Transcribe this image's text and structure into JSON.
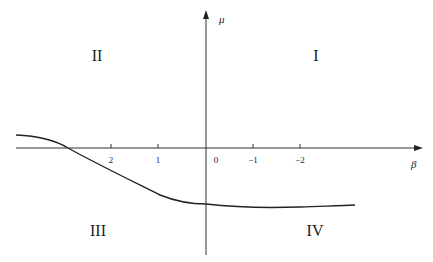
{
  "diagram": {
    "axes": {
      "horizontal_label": "β",
      "vertical_label": "μ"
    },
    "ticks": [
      {
        "label": "2",
        "x": 111
      },
      {
        "label": "1",
        "x": 158
      },
      {
        "label": "0",
        "x": 216
      },
      {
        "label": "−1",
        "x": 253
      },
      {
        "label": "−2",
        "x": 300
      }
    ],
    "quadrants": {
      "I": "I",
      "II": "II",
      "III": "III",
      "IV": "IV"
    },
    "colors": {
      "line": "#222222",
      "axis": "#333333"
    }
  }
}
